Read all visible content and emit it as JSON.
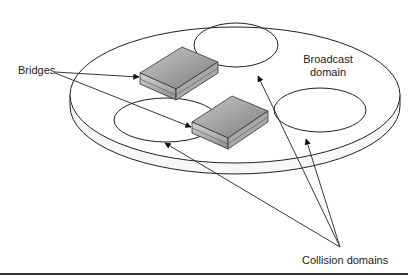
{
  "diagram": {
    "labels": {
      "bridges": "Bridges",
      "broadcast_line1": "Broadcast",
      "broadcast_line2": "domain",
      "collision": "Collision domains"
    },
    "elements": {
      "broadcast_domain": "large platter ellipse",
      "collision_domains": 3,
      "bridges": 2
    },
    "colors": {
      "line": "#222222",
      "device_top": "#9a9a9a",
      "device_side": "#bdbdbd",
      "background": "#ffffff"
    }
  }
}
